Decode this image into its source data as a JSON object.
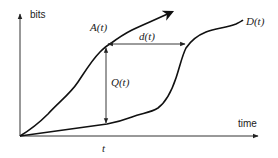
{
  "diagram": {
    "y_axis_label": "bits",
    "x_axis_label": "time",
    "curves": [
      {
        "name": "arrival",
        "label": "A(t)"
      },
      {
        "name": "departure",
        "label": "D(t)"
      }
    ],
    "annotations": {
      "queue": "Q(t)",
      "delay": "d(t)",
      "time_marker": "t"
    },
    "colors": {
      "stroke": "#111111",
      "axis": "#333333",
      "background": "#ffffff"
    }
  }
}
